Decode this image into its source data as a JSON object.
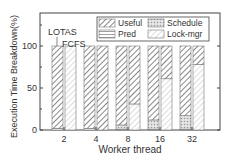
{
  "chart_data": {
    "type": "bar",
    "stacked": true,
    "title": "",
    "xlabel": "Worker thread",
    "ylabel": "Execution Time Breakdown(%)",
    "ylim": [
      0,
      135
    ],
    "yticks": [
      0,
      50,
      100
    ],
    "categories": [
      "2",
      "4",
      "8",
      "16",
      "32"
    ],
    "groups": [
      "LOTAS",
      "FCFS"
    ],
    "annotations": [
      "LOTAS",
      "FCFS"
    ],
    "legend": [
      "Useful",
      "Schedule",
      "Pred",
      "Lock-mgr"
    ],
    "series": [
      {
        "name": "Pred",
        "pattern": "hlines",
        "LOTAS": [
          2,
          2,
          1,
          1,
          1
        ],
        "FCFS": [
          0,
          0,
          0,
          0,
          0
        ]
      },
      {
        "name": "Schedule",
        "pattern": "dots",
        "LOTAS": [
          0,
          0,
          5,
          11,
          16
        ],
        "FCFS": [
          0,
          0,
          0,
          0,
          0
        ]
      },
      {
        "name": "Lock-mgr",
        "pattern": "light-diag",
        "LOTAS": [
          0,
          0,
          0,
          0,
          0
        ],
        "FCFS": [
          100,
          0,
          31,
          61,
          78
        ]
      },
      {
        "name": "Useful",
        "pattern": "dark-diag",
        "LOTAS": [
          98,
          98,
          94,
          88,
          83
        ],
        "FCFS": [
          0,
          100,
          69,
          39,
          22
        ]
      }
    ]
  }
}
